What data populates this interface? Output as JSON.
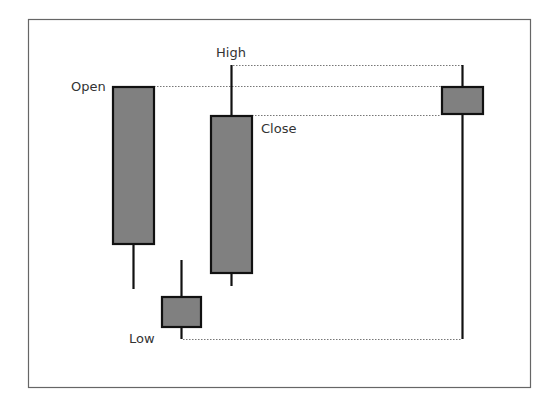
{
  "diagram": {
    "title": "",
    "colors": {
      "frame": "#666666",
      "body_fill": "#808080",
      "stroke": "#111111",
      "dotted_guide": "#777777",
      "label_text": "#333333",
      "background": "#ffffff"
    },
    "labels": {
      "open": "Open",
      "high": "High",
      "close": "Close",
      "low": "Low"
    },
    "candles": [
      {
        "name": "candle-1",
        "open": 86,
        "close": 244,
        "high": 86,
        "low": 289,
        "x": 112,
        "width": 42
      },
      {
        "name": "candle-2",
        "open": 297,
        "close": 327,
        "high": 260,
        "low": 339,
        "x": 161,
        "width": 40
      },
      {
        "name": "candle-3",
        "open": 116,
        "close": 273,
        "high": 65,
        "low": 286,
        "x": 210,
        "width": 42
      },
      {
        "name": "candle-summary",
        "open": 86,
        "close": 114,
        "high": 65,
        "low": 339,
        "x": 441,
        "width": 42
      }
    ]
  }
}
